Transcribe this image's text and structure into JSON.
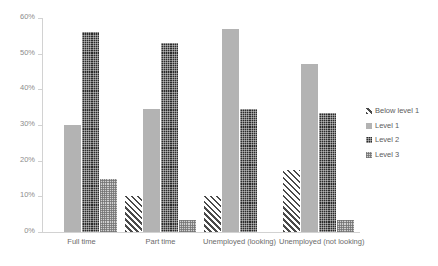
{
  "chart_data": {
    "type": "bar",
    "title": "",
    "subtitle": "",
    "xlabel": "",
    "ylabel": "",
    "ylim": [
      0,
      60
    ],
    "ytick_labels": [
      "0%",
      "10%",
      "20%",
      "30%",
      "40%",
      "50%",
      "60%"
    ],
    "ytick_values": [
      0,
      10,
      20,
      30,
      40,
      50,
      60
    ],
    "grid": false,
    "legend_position": "right",
    "categories": [
      "Full time",
      "Part time",
      "Unemployed (looking)",
      "Unemployed (not looking)"
    ],
    "series": [
      {
        "name": "Below level 1",
        "pattern": "diagonal-stripe",
        "color": "#4a4a4a",
        "values": [
          0,
          10,
          10,
          17.5
        ]
      },
      {
        "name": "Level 1",
        "pattern": "solid-light-gray",
        "color": "#b3b3b3",
        "values": [
          30,
          34.5,
          57,
          47
        ]
      },
      {
        "name": "Level 2",
        "pattern": "dark-checker",
        "color": "#2b2b2b",
        "values": [
          56,
          53,
          34.5,
          33.5
        ]
      },
      {
        "name": "Level 3",
        "pattern": "light-checker",
        "color": "#cfcfcf",
        "values": [
          15,
          3.5,
          0,
          3.5
        ]
      }
    ]
  }
}
